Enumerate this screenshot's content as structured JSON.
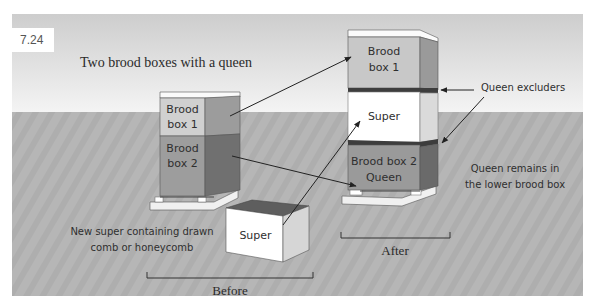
{
  "figure": {
    "number": "7.24",
    "title": "Two brood boxes with a queen"
  },
  "before": {
    "label": "Before",
    "hive": {
      "boxes": [
        {
          "line1": "Brood",
          "line2": "box 1"
        },
        {
          "line1": "Brood",
          "line2": "box 2"
        }
      ]
    },
    "new_super": {
      "label": "Super",
      "caption_line1": "New super containing drawn",
      "caption_line2": "comb or honeycomb"
    }
  },
  "after": {
    "label": "After",
    "hive": {
      "boxes": [
        {
          "line1": "Brood",
          "line2": "box 1"
        },
        {
          "line1": "Super",
          "line2": ""
        },
        {
          "line1": "Brood box 2",
          "line2": "Queen"
        }
      ]
    },
    "annotations": {
      "queen_excluders": "Queen excluders",
      "queen_note_line1": "Queen remains in",
      "queen_note_line2": "the lower brood box"
    }
  },
  "colors": {
    "sky_top": "#cfcfcf",
    "sky_bottom": "#f2f2f2",
    "ground": "#b4b4b4",
    "brood1_front": "#c9c9c9",
    "brood1_side": "#9a9a9a",
    "brood2_front": "#9b9b9b",
    "brood2_side": "#6e6e6e",
    "super_front": "#ffffff",
    "super_side": "#d8d8d8",
    "excluder": "#3a3a3a"
  }
}
